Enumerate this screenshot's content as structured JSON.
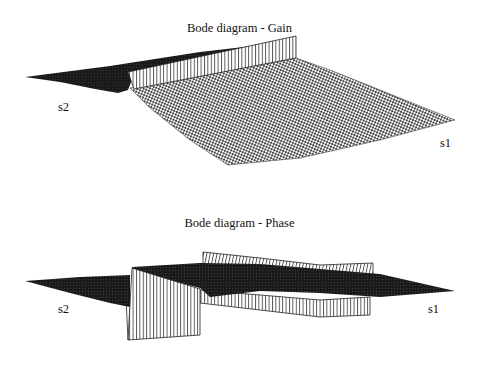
{
  "figure": {
    "plots": [
      {
        "id": "gain",
        "title": "Bode diagram - Gain",
        "axis_labels": {
          "left": "s2",
          "right": "s1"
        },
        "type": "3d-surface-mesh"
      },
      {
        "id": "phase",
        "title": "Bode diagram - Phase",
        "axis_labels": {
          "left": "s2",
          "right": "s1"
        },
        "type": "3d-surface-mesh"
      }
    ],
    "colors": {
      "background": "#ffffff",
      "ink": "#111111",
      "dark_surface": "#1a1a1a",
      "mesh": "#555555"
    }
  }
}
